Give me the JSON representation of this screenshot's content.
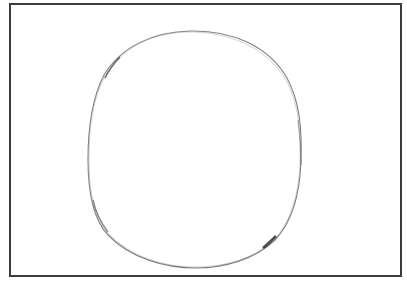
{
  "drawing": {
    "subject": "hand-drawn pencil circle",
    "frame_color": "#3c3c3c",
    "stroke_color": "#555555",
    "background": "#ffffff"
  }
}
